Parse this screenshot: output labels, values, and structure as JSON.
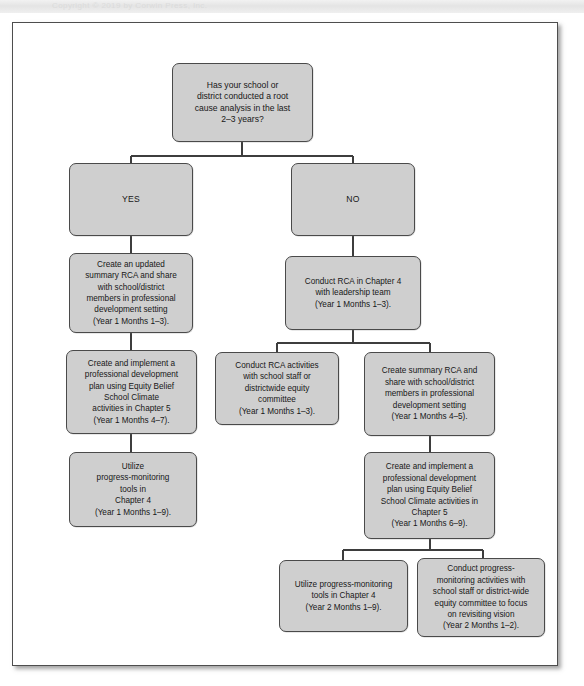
{
  "header": {
    "strip_text": "Copyright  ©  2019  by  Corwin  Press,  Inc."
  },
  "diagram": {
    "box_fill": "#cfcfcf",
    "box_stroke": "#4a4a4a",
    "page_stroke": "#4d4d4d",
    "nodes": [
      {
        "id": "decision",
        "label": "Has your school or\ndistrict conducted a root\ncause analysis in the last\n2–3 years?",
        "name": "decision-root-cause-analysis"
      },
      {
        "id": "yes",
        "label": "YES",
        "name": "branch-yes"
      },
      {
        "id": "no",
        "label": "NO",
        "name": "branch-no"
      },
      {
        "id": "yes1",
        "label": "Create an updated\nsummary RCA and share\nwith school/district\nmembers in professional\ndevelopment setting\n(Year 1 Months 1–3).",
        "name": "step-yes-create-updated-summary-rca"
      },
      {
        "id": "yes2",
        "label": "Create and implement a\nprofessional development\nplan using Equity Belief\nSchool Climate\nactivities in Chapter 5\n(Year 1 Months 4–7).",
        "name": "step-yes-professional-development-plan"
      },
      {
        "id": "yes3",
        "label": "Utilize\nprogress-monitoring\ntools in\nChapter 4\n(Year 1 Months 1–9).",
        "name": "step-yes-progress-monitoring-tools"
      },
      {
        "id": "no1",
        "label": "Conduct RCA in Chapter 4\nwith leadership team\n(Year 1 Months 1–3).",
        "name": "step-no-conduct-rca-leadership-team"
      },
      {
        "id": "no2a",
        "label": "Conduct RCA activities\nwith school staff or\ndistrictwide equity\ncommittee\n(Year 1 Months 1–3).",
        "name": "step-no-conduct-rca-activities-staff"
      },
      {
        "id": "no2b",
        "label": "Create summary RCA and\nshare with school/district\nmembers in professional\ndevelopment setting\n(Year 1 Months 4–5).",
        "name": "step-no-create-summary-rca"
      },
      {
        "id": "no3",
        "label": "Create and implement a\nprofessional development\nplan using Equity Belief\nSchool Climate activities in\nChapter 5\n(Year 1 Months 6–9).",
        "name": "step-no-professional-development-plan"
      },
      {
        "id": "no4a",
        "label": "Utilize progress-monitoring\ntools in Chapter 4\n(Year 2 Months 1–9).",
        "name": "step-no-progress-monitoring-tools"
      },
      {
        "id": "no4b",
        "label": "Conduct progress-\nmonitoring activities with\nschool staff or district-wide\nequity committee to focus\non revisiting vision\n(Year 2 Months 1–2).",
        "name": "step-no-progress-monitoring-activities"
      }
    ]
  }
}
